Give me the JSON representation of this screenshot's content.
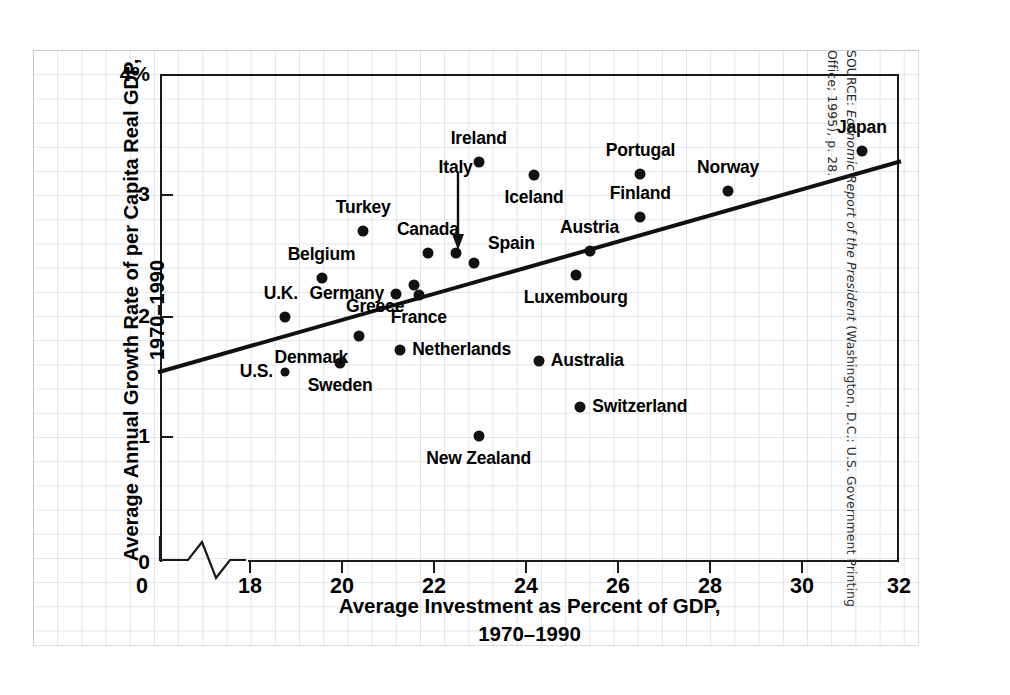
{
  "chart_data": {
    "type": "scatter",
    "title": "",
    "xlabel": "Average Investment as Percent of GDP, 1970–1990",
    "ylabel": "Average Annual Growth Rate of per Capita Real GDP, 1970–1990",
    "xlim": [
      16,
      32
    ],
    "ylim": [
      0,
      4
    ],
    "xticks": [
      18,
      20,
      22,
      24,
      26,
      28,
      30,
      32
    ],
    "xtick_labels": [
      "18",
      "20",
      "22",
      "24",
      "26",
      "28",
      "30",
      "32"
    ],
    "yticks": [
      0,
      1,
      2,
      3,
      4
    ],
    "ytick_labels": [
      "0",
      "1",
      "2",
      "3",
      "4%"
    ],
    "axis_break_x": true,
    "grid": true,
    "legend": false,
    "trendline": {
      "x0": 16.0,
      "y0": 1.56,
      "x1": 32.0,
      "y1": 3.28
    },
    "points": [
      {
        "name": "U.S.",
        "x": 18.7,
        "y": 1.56,
        "label_pos": "left"
      },
      {
        "name": "U.K.",
        "x": 18.7,
        "y": 2.01,
        "label_pos": "above-left"
      },
      {
        "name": "Belgium",
        "x": 19.5,
        "y": 2.33,
        "label_pos": "above"
      },
      {
        "name": "Sweden",
        "x": 19.9,
        "y": 1.63,
        "label_pos": "below"
      },
      {
        "name": "Denmark",
        "x": 20.3,
        "y": 1.85,
        "label_pos": "below-left"
      },
      {
        "name": "Turkey",
        "x": 20.4,
        "y": 2.71,
        "label_pos": "above"
      },
      {
        "name": "Germany",
        "x": 21.1,
        "y": 2.2,
        "label_pos": "left"
      },
      {
        "name": "Netherlands",
        "x": 21.2,
        "y": 1.74,
        "label_pos": "right"
      },
      {
        "name": "Greece",
        "x": 21.5,
        "y": 2.27,
        "label_pos": "below-left"
      },
      {
        "name": "France",
        "x": 21.6,
        "y": 2.19,
        "label_pos": "below"
      },
      {
        "name": "Canada",
        "x": 21.8,
        "y": 2.53,
        "label_pos": "above"
      },
      {
        "name": "Italy",
        "x": 22.4,
        "y": 2.53,
        "label_pos": "arrow-above"
      },
      {
        "name": "Spain",
        "x": 22.8,
        "y": 2.45,
        "label_pos": "above-right"
      },
      {
        "name": "Ireland",
        "x": 22.9,
        "y": 3.28,
        "label_pos": "above"
      },
      {
        "name": "New Zealand",
        "x": 22.9,
        "y": 1.03,
        "label_pos": "below"
      },
      {
        "name": "Iceland",
        "x": 24.1,
        "y": 3.17,
        "label_pos": "below"
      },
      {
        "name": "Australia",
        "x": 24.2,
        "y": 1.65,
        "label_pos": "right"
      },
      {
        "name": "Switzerland",
        "x": 25.1,
        "y": 1.27,
        "label_pos": "right"
      },
      {
        "name": "Luxembourg",
        "x": 25.0,
        "y": 2.35,
        "label_pos": "below"
      },
      {
        "name": "Austria",
        "x": 25.3,
        "y": 2.55,
        "label_pos": "above"
      },
      {
        "name": "Finland",
        "x": 26.4,
        "y": 2.83,
        "label_pos": "above"
      },
      {
        "name": "Portugal",
        "x": 26.4,
        "y": 3.18,
        "label_pos": "above"
      },
      {
        "name": "Norway",
        "x": 28.3,
        "y": 3.04,
        "label_pos": "above"
      },
      {
        "name": "Japan",
        "x": 31.2,
        "y": 3.37,
        "label_pos": "above"
      }
    ]
  },
  "axes": {
    "y_top_label": "4%",
    "y_labels": [
      "4%",
      "3",
      "2",
      "1",
      "0"
    ],
    "x_labels": [
      "18",
      "20",
      "22",
      "24",
      "26",
      "28",
      "30",
      "32"
    ],
    "x_zero_label": "0"
  },
  "titles": {
    "ylabel_line1": "Average Annual Growth Rate of per Capita Real GDP,",
    "ylabel_line2": "1970–1990",
    "xlabel_line1": "Average Investment as Percent of GDP,",
    "xlabel_line2": "1970–1990"
  },
  "source": {
    "prefix": "SOURCE: ",
    "italic": "Economic Report of the President",
    "suffix": " (Washington, D.C.: U.S. Government Printing Office; 1995), p. 28."
  },
  "colors": {
    "ink": "#111111",
    "grid": "#a0aab9",
    "paper": "#ffffff"
  }
}
